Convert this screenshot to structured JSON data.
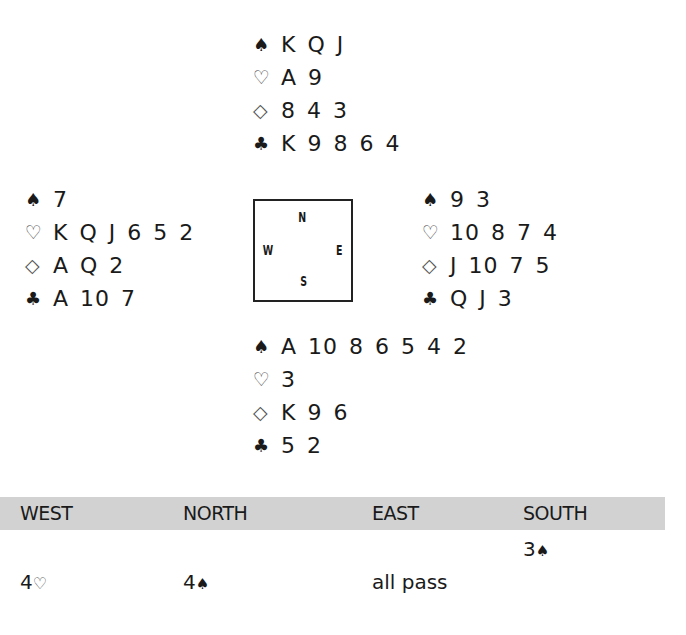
{
  "symbols": {
    "spade": "♠",
    "heart": "♡",
    "diamond": "◇",
    "club": "♣"
  },
  "hands": {
    "north": {
      "spades": "K Q J",
      "hearts": "A 9",
      "diamonds": "8 4 3",
      "clubs": "K 9 8 6 4"
    },
    "west": {
      "spades": "7",
      "hearts": "K Q J 6 5 2",
      "diamonds": "A Q 2",
      "clubs": "A 10 7"
    },
    "east": {
      "spades": "9 3",
      "hearts": "10 8 7 4",
      "diamonds": "J 10 7 5",
      "clubs": "Q J 3"
    },
    "south": {
      "spades": "A 10 8 6 5 4 2",
      "hearts": "3",
      "diamonds": "K 9 6",
      "clubs": "5 2"
    }
  },
  "compass": {
    "north": "N",
    "west": "W",
    "east": "E",
    "south": "S"
  },
  "bidding": {
    "header_color": "#d2d2d2",
    "columns": [
      "WEST",
      "NORTH",
      "EAST",
      "SOUTH"
    ],
    "rows": [
      {
        "west": "",
        "north": "",
        "east": "",
        "south": {
          "level": "3",
          "suit": "♠"
        }
      },
      {
        "west": {
          "level": "4",
          "suit": "♡"
        },
        "north": {
          "level": "4",
          "suit": "♠"
        },
        "east": "all pass",
        "south": ""
      }
    ]
  }
}
